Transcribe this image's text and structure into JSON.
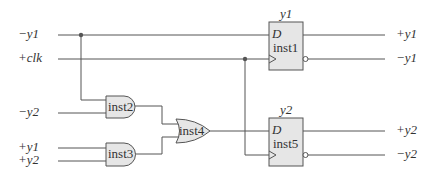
{
  "inputs": {
    "neg_y1": "−y1",
    "clk": "+clk",
    "neg_y2": "−y2",
    "pos_y1": "+y1",
    "pos_y2": "+y2"
  },
  "flipflops": [
    {
      "name": "inst1",
      "state_label": "y1",
      "d_label": "D",
      "out_pos": "+y1",
      "out_neg": "−y1"
    },
    {
      "name": "inst5",
      "state_label": "y2",
      "d_label": "D",
      "out_pos": "+y2",
      "out_neg": "−y2"
    }
  ],
  "gates": [
    {
      "name": "inst2",
      "type": "AND"
    },
    {
      "name": "inst3",
      "type": "AND"
    },
    {
      "name": "inst4",
      "type": "OR"
    }
  ],
  "colors": {
    "wire": "#555555",
    "gate_fill": "#e6e6e6"
  }
}
